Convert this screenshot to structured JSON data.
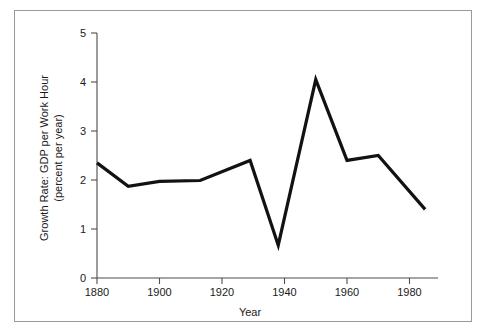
{
  "figure": {
    "background_color": "#ffffff",
    "frame_color": "#9a9a9a",
    "axis_color": "#4d4d4d",
    "line_color": "#121212"
  },
  "chart_data": {
    "type": "line",
    "title": "",
    "xlabel": "Year",
    "ylabel": "Growth Rate: GDP per Work Hour (percent per year)",
    "ylabel_line1": "Growth Rate: GDP per Work Hour",
    "ylabel_line2": "(percent per year)",
    "xlim": [
      1880,
      1990
    ],
    "ylim": [
      0,
      5
    ],
    "xticks": [
      1880,
      1900,
      1920,
      1940,
      1960,
      1980
    ],
    "xtick_labels": [
      "1880",
      "1900",
      "1920",
      "1940",
      "1960",
      "1980"
    ],
    "yticks": [
      0,
      1,
      2,
      3,
      4,
      5
    ],
    "ytick_labels": [
      "0",
      "1",
      "2",
      "3",
      "4",
      "5"
    ],
    "grid": false,
    "legend": false,
    "series": [
      {
        "name": "GDP per work hour growth rate",
        "x": [
          1880,
          1890,
          1900,
          1913,
          1929,
          1938,
          1950,
          1960,
          1970,
          1985
        ],
        "values": [
          2.35,
          1.87,
          1.97,
          1.99,
          2.4,
          0.67,
          4.05,
          2.4,
          2.5,
          1.4
        ]
      }
    ]
  }
}
